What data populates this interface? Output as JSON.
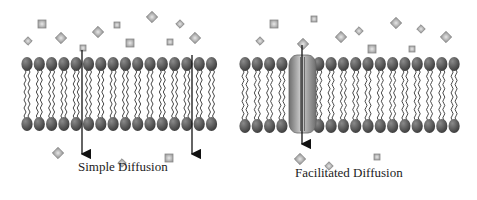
{
  "panels": [
    {
      "id": "simple",
      "label": "Simple Diffusion",
      "label_pos": [
        78,
        171
      ],
      "membrane": {
        "x_start": 27,
        "count": 16,
        "spacing": 12.3,
        "top_y": 64,
        "bottom_y": 124
      },
      "arrows": [
        {
          "x": 82,
          "y1": 50,
          "y2": 160
        },
        {
          "x": 192,
          "y1": 55,
          "y2": 160
        }
      ],
      "molecules_above": [
        [
          28,
          41,
          3,
          45
        ],
        [
          42,
          24,
          4,
          0
        ],
        [
          61,
          38,
          4,
          45
        ],
        [
          83,
          48,
          3,
          0
        ],
        [
          98,
          32,
          4,
          45
        ],
        [
          117,
          25,
          3,
          0
        ],
        [
          130,
          43,
          4,
          0
        ],
        [
          152,
          17,
          4,
          45
        ],
        [
          170,
          42,
          3,
          0
        ],
        [
          180,
          24,
          3,
          45
        ],
        [
          195,
          38,
          4,
          45
        ]
      ],
      "molecules_below": [
        [
          58,
          153,
          4,
          45
        ],
        [
          122,
          163,
          3,
          45
        ],
        [
          169,
          158,
          4,
          0
        ]
      ]
    },
    {
      "id": "facilitated",
      "label": "Facilitated Diffusion",
      "label_pos": [
        295,
        177
      ],
      "membrane": {
        "x_start": 245,
        "count": 18,
        "spacing": 12.3,
        "top_y": 64,
        "bottom_y": 126
      },
      "channel": {
        "x": 289,
        "y": 55,
        "width": 27,
        "height": 78
      },
      "channel_skip": [
        4
      ],
      "arrows": [
        {
          "x": 302,
          "y1": 45,
          "y2": 150
        }
      ],
      "molecules_above": [
        [
          260,
          41,
          3,
          45
        ],
        [
          274,
          24,
          4,
          0
        ],
        [
          314,
          19,
          3,
          0
        ],
        [
          303,
          44,
          4,
          45
        ],
        [
          341,
          37,
          4,
          45
        ],
        [
          359,
          31,
          3,
          45
        ],
        [
          372,
          49,
          4,
          0
        ],
        [
          396,
          23,
          4,
          45
        ],
        [
          421,
          29,
          3,
          45
        ],
        [
          412,
          49,
          3,
          0
        ],
        [
          446,
          37,
          4,
          45
        ]
      ],
      "molecules_below": [
        [
          300,
          159,
          4,
          45
        ],
        [
          329,
          166,
          3,
          45
        ],
        [
          377,
          157,
          3,
          0
        ]
      ]
    }
  ],
  "colors": {
    "head": "#3a3a3a",
    "head_highlight": "#8a8a8a",
    "tail": "#333333",
    "molecule_fill": "#c9c9c9",
    "molecule_stroke": "#8a8a8a",
    "channel": "#9a9a9a",
    "arrow": "#111111"
  }
}
